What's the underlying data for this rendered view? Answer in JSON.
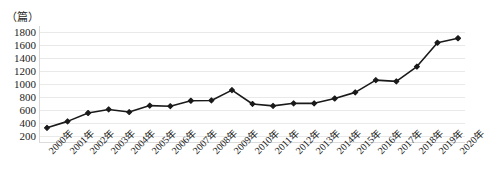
{
  "chart_data": {
    "type": "line",
    "title": "",
    "xlabel": "",
    "ylabel": "",
    "unit_label": "（篇）",
    "categories": [
      "2000年",
      "2001年",
      "2002年",
      "2003年",
      "2004年",
      "2005年",
      "2006年",
      "2007年",
      "2008年",
      "2009年",
      "2010年",
      "2011年",
      "2012年",
      "2013年",
      "2014年",
      "2015年",
      "2016年",
      "2017年",
      "2018年",
      "2019年",
      "2020年"
    ],
    "values": [
      320,
      420,
      550,
      605,
      565,
      665,
      655,
      740,
      745,
      905,
      690,
      660,
      700,
      700,
      775,
      870,
      1060,
      1040,
      1270,
      1640,
      1710
    ],
    "series": [
      {
        "name": "论文数量",
        "values": [
          320,
          420,
          550,
          605,
          565,
          665,
          655,
          740,
          745,
          905,
          690,
          660,
          700,
          700,
          775,
          870,
          1060,
          1040,
          1270,
          1640,
          1710
        ]
      }
    ],
    "yticks": [
      200,
      400,
      600,
      800,
      1000,
      1200,
      1400,
      1600,
      1800
    ],
    "ytick_labels": [
      "200",
      "400",
      "600",
      "800",
      "1000",
      "1200",
      "1400",
      "1600",
      "1800"
    ],
    "ylim": [
      100,
      1900
    ],
    "grid": true,
    "legend": false,
    "legend_position": "none",
    "line_color": "#1a1a1a",
    "marker_color": "#1a1a1a",
    "marker": "diamond",
    "grid_color": "#e9e9e9"
  }
}
